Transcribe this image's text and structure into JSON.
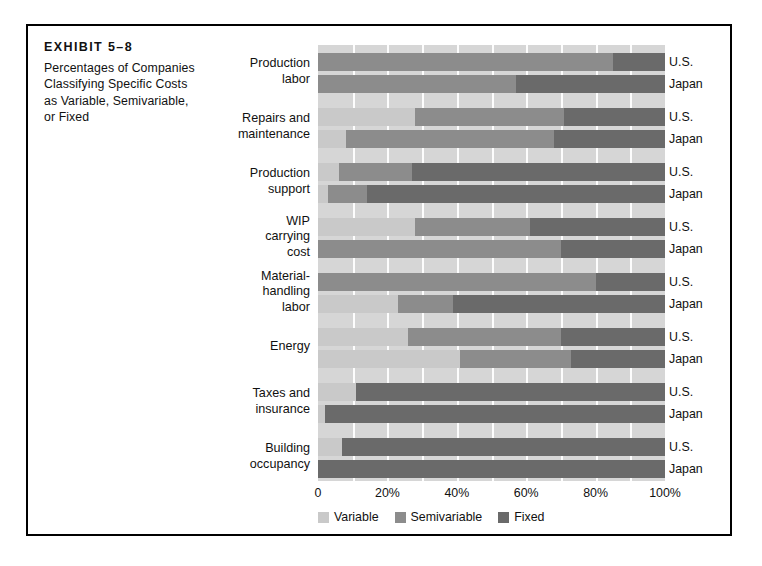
{
  "exhibit": {
    "number_label": "EXHIBIT 5–8",
    "description_lines": [
      "Percentages of Companies",
      "Classifying Specific Costs",
      "as Variable, Semivariable,",
      "or Fixed"
    ]
  },
  "legend": {
    "items": [
      {
        "label": "Variable",
        "color": "#c9c9c9",
        "key": "variable"
      },
      {
        "label": "Semivariable",
        "color": "#8c8c8c",
        "key": "semivariable"
      },
      {
        "label": "Fixed",
        "color": "#6a6a6a",
        "key": "fixed"
      }
    ]
  },
  "axis": {
    "ticks": [
      {
        "label": "0",
        "value": 0
      },
      {
        "label": "20%",
        "value": 20
      },
      {
        "label": "40%",
        "value": 40
      },
      {
        "label": "60%",
        "value": 60
      },
      {
        "label": "80%",
        "value": 80
      },
      {
        "label": "100%",
        "value": 100
      }
    ]
  },
  "chart_data": {
    "type": "bar",
    "orientation": "horizontal",
    "stacked": true,
    "xlabel": "",
    "ylabel": "",
    "xlim": [
      0,
      100
    ],
    "grid": true,
    "gridlines_every": 10,
    "legend_position": "bottom",
    "series": [
      {
        "name": "Variable",
        "color": "#c9c9c9"
      },
      {
        "name": "Semivariable",
        "color": "#8c8c8c"
      },
      {
        "name": "Fixed",
        "color": "#6a6a6a"
      }
    ],
    "groups": [
      {
        "category_lines": [
          "Production",
          "labor"
        ],
        "bars": [
          {
            "country": "U.S.",
            "variable": 0,
            "semivariable": 85,
            "fixed": 15
          },
          {
            "country": "Japan",
            "variable": 0,
            "semivariable": 57,
            "fixed": 43
          }
        ]
      },
      {
        "category_lines": [
          "Repairs and",
          "maintenance"
        ],
        "bars": [
          {
            "country": "U.S.",
            "variable": 28,
            "semivariable": 43,
            "fixed": 29
          },
          {
            "country": "Japan",
            "variable": 8,
            "semivariable": 60,
            "fixed": 32
          }
        ]
      },
      {
        "category_lines": [
          "Production",
          "support"
        ],
        "bars": [
          {
            "country": "U.S.",
            "variable": 6,
            "semivariable": 21,
            "fixed": 73
          },
          {
            "country": "Japan",
            "variable": 3,
            "semivariable": 11,
            "fixed": 86
          }
        ]
      },
      {
        "category_lines": [
          "WIP",
          "carrying",
          "cost"
        ],
        "bars": [
          {
            "country": "U.S.",
            "variable": 28,
            "semivariable": 33,
            "fixed": 39
          },
          {
            "country": "Japan",
            "variable": 0,
            "semivariable": 70,
            "fixed": 30
          }
        ]
      },
      {
        "category_lines": [
          "Material-",
          "handling",
          "labor"
        ],
        "bars": [
          {
            "country": "U.S.",
            "variable": 0,
            "semivariable": 80,
            "fixed": 20
          },
          {
            "country": "Japan",
            "variable": 23,
            "semivariable": 16,
            "fixed": 61
          }
        ]
      },
      {
        "category_lines": [
          "Energy"
        ],
        "bars": [
          {
            "country": "U.S.",
            "variable": 26,
            "semivariable": 44,
            "fixed": 30
          },
          {
            "country": "Japan",
            "variable": 41,
            "semivariable": 32,
            "fixed": 27
          }
        ]
      },
      {
        "category_lines": [
          "Taxes and",
          "insurance"
        ],
        "bars": [
          {
            "country": "U.S.",
            "variable": 11,
            "semivariable": 0,
            "fixed": 89
          },
          {
            "country": "Japan",
            "variable": 2,
            "semivariable": 0,
            "fixed": 98
          }
        ]
      },
      {
        "category_lines": [
          "Building",
          "occupancy"
        ],
        "bars": [
          {
            "country": "U.S.",
            "variable": 7,
            "semivariable": 0,
            "fixed": 93
          },
          {
            "country": "Japan",
            "variable": 0,
            "semivariable": 0,
            "fixed": 100
          }
        ]
      }
    ]
  }
}
